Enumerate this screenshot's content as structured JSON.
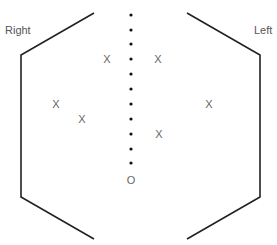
{
  "labels": {
    "right": "Right",
    "left": "Left"
  },
  "marks": {
    "x_symbol": "X",
    "o_symbol": "O",
    "x_positions": [
      {
        "x": 107,
        "y": 59
      },
      {
        "x": 158,
        "y": 59
      },
      {
        "x": 56,
        "y": 104
      },
      {
        "x": 82,
        "y": 119
      },
      {
        "x": 209,
        "y": 104
      },
      {
        "x": 159,
        "y": 134
      }
    ],
    "o_position": {
      "x": 131,
      "y": 180
    }
  },
  "center_line": {
    "x": 131,
    "dot_count": 11,
    "dot_y": [
      15,
      30,
      44,
      59,
      74,
      89,
      104,
      119,
      134,
      149,
      163
    ]
  }
}
